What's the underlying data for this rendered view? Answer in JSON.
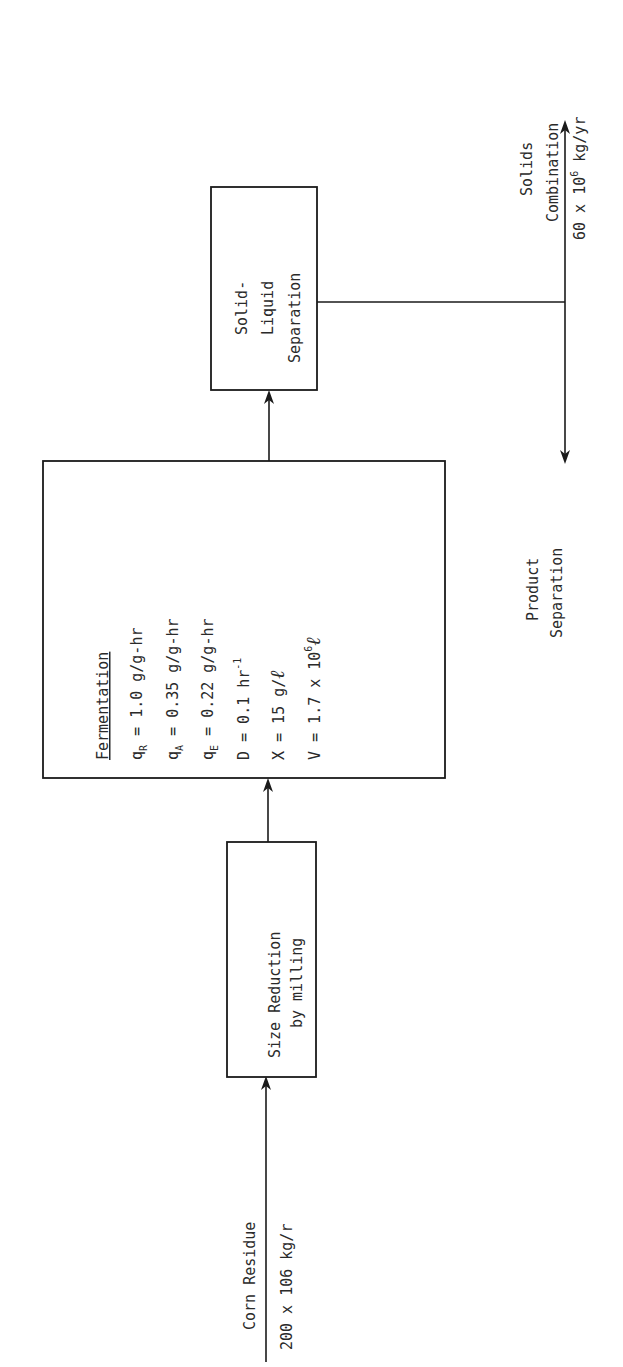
{
  "diagram": {
    "type": "process-flow",
    "orientation": "rotated-90-ccw",
    "input": {
      "label": "Corn Residue",
      "rate": "200 x 106 kg/r"
    },
    "nodes": [
      {
        "id": "size-reduction",
        "lines": [
          "Size Reduction",
          "by milling"
        ]
      },
      {
        "id": "fermentation",
        "title": "Fermentation",
        "params": [
          {
            "sym": "q",
            "sub": "R",
            "eq": "= 1.0 g/g-hr"
          },
          {
            "sym": "q",
            "sub": "A",
            "eq": "= 0.35 g/g-hr"
          },
          {
            "sym": "q",
            "sub": "E",
            "eq": "= 0.22 g/g-hr"
          },
          {
            "sym": "D",
            "sub": "",
            "eq": "= 0.1 hr",
            "sup": "-1"
          },
          {
            "sym": "X",
            "sub": "",
            "eq": "= 15 g/",
            "script": "ℓ"
          },
          {
            "sym": "V",
            "sub": "",
            "eq": "= 1.7 x 10",
            "sup": "6",
            "script": "ℓ"
          }
        ]
      },
      {
        "id": "solid-liquid-separation",
        "lines": [
          "Solid-",
          "Liquid",
          "Separation"
        ]
      }
    ],
    "outputs": [
      {
        "id": "solids-combination",
        "lines": [
          "Solids",
          "Combination"
        ],
        "rate_prefix": "60 x 10",
        "rate_sup": "6",
        "rate_suffix": " kg/yr"
      },
      {
        "id": "product-separation",
        "lines": [
          "Product",
          "Separation"
        ]
      }
    ]
  }
}
